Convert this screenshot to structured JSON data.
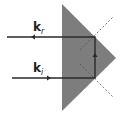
{
  "diagram": {
    "type": "prism-retroreflection",
    "labels": {
      "reflected": {
        "main": "k",
        "sub": "r"
      },
      "incident": {
        "main": "k",
        "sub": "i"
      }
    },
    "colors": {
      "prism_fill": "#7a7a7a",
      "ray": "#2a2a2a",
      "dashed_normal": "#555555",
      "background": "#ffffff"
    }
  }
}
